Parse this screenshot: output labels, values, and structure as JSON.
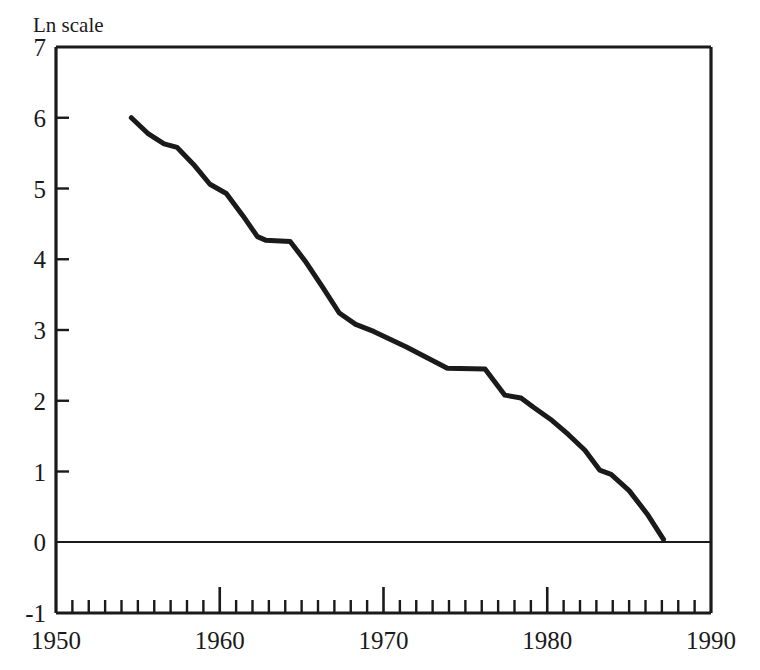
{
  "chart_data": {
    "type": "line",
    "title": "Ln scale",
    "xlabel": "",
    "ylabel": "Ln scale",
    "xlim": [
      1950,
      1990
    ],
    "ylim": [
      -1,
      7
    ],
    "grid": false,
    "legend": null,
    "x_tick_labels": [
      "1950",
      "1960",
      "1970",
      "1980",
      "1990"
    ],
    "x_major_ticks": [
      1950,
      1960,
      1970,
      1980,
      1990
    ],
    "x_minor_tick_interval": 1,
    "y_tick_labels": [
      "7",
      "6",
      "5",
      "4",
      "3",
      "2",
      "1",
      "0",
      "-1"
    ],
    "y_ticks": [
      7,
      6,
      5,
      4,
      3,
      2,
      1,
      0,
      -1
    ],
    "zero_reference_line": 0,
    "series": [
      {
        "name": "ln series",
        "color": "#1a1a1a",
        "x": [
          1954.6,
          1955.6,
          1956.6,
          1957.4,
          1958.4,
          1959.4,
          1960.4,
          1961.4,
          1962.3,
          1962.8,
          1964.3,
          1965.2,
          1966.3,
          1967.3,
          1968.3,
          1969.4,
          1970.4,
          1971.4,
          1972.4,
          1973.4,
          1973.9,
          1976.2,
          1977.4,
          1978.4,
          1979.2,
          1980.3,
          1981.3,
          1982.3,
          1983.2,
          1983.9,
          1985.0,
          1986.1,
          1987.1
        ],
        "y": [
          6.0,
          5.78,
          5.63,
          5.58,
          5.34,
          5.06,
          4.93,
          4.62,
          4.32,
          4.27,
          4.25,
          3.98,
          3.6,
          3.24,
          3.08,
          2.98,
          2.87,
          2.76,
          2.64,
          2.52,
          2.46,
          2.45,
          2.08,
          2.04,
          1.9,
          1.72,
          1.52,
          1.3,
          1.02,
          0.96,
          0.73,
          0.4,
          0.04
        ]
      }
    ]
  },
  "labels": {
    "axis_note": "Ln scale"
  }
}
